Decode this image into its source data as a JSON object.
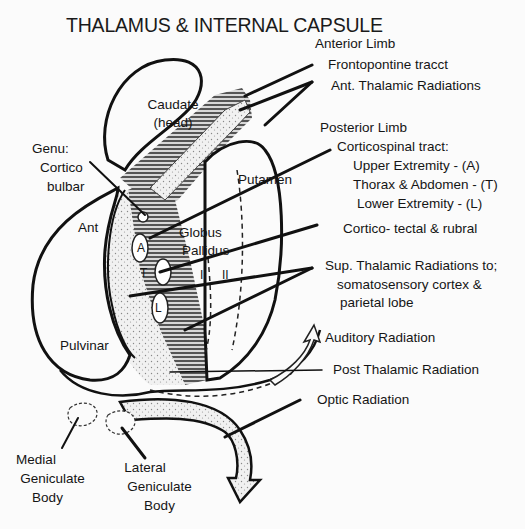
{
  "title": "THALAMUS & INTERNAL CAPSULE",
  "labels": {
    "anterior_limb": "Anterior Limb",
    "frontopontine": "Frontopontine tracct",
    "ant_thalamic": "Ant. Thalamic Radiations",
    "caudate_1": "Caudate",
    "caudate_2": "(head)",
    "genu_1": "Genu:",
    "genu_2": "Cortico",
    "genu_3": "bulbar",
    "posterior_limb": "Posterior Limb",
    "corticospinal": "Corticospinal tract:",
    "upper": "Upper Extremity - (A)",
    "thorax": "Thorax & Abdomen -  (T)",
    "lower": "Lower Extremity - (L)",
    "putamen": "Putamen",
    "globus_1": "Globus",
    "globus_2": "Pallidus",
    "ant": "Ant",
    "cortico_tectal": "Cortico- tectal & rubral",
    "sup_thalamic_1": "Sup. Thalamic Radiations to;",
    "sup_thalamic_2": "somatosensory cortex &",
    "sup_thalamic_3": "parietal lobe",
    "auditory": "Auditory Radiation",
    "pulvinar": "Pulvinar",
    "post_thalamic": "Post Thalamic Radiation",
    "optic": "Optic Radiation",
    "medial_1": "Medial",
    "medial_2": "Geniculate",
    "medial_3": "Body",
    "lateral_1": "Lateral",
    "lateral_2": "Geniculate",
    "lateral_3": "Body",
    "tract_a": "A",
    "tract_t": "T",
    "tract_l": "L",
    "zone_i": "I",
    "zone_ii": "II"
  }
}
